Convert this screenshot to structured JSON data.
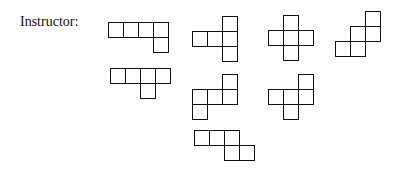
{
  "label": "Instructor:",
  "cell_size": 15,
  "stroke_color": "#111111",
  "shapes": [
    {
      "id": "shape-1",
      "x": 108,
      "y": 22,
      "cells": [
        [
          0,
          0
        ],
        [
          1,
          0
        ],
        [
          2,
          0
        ],
        [
          3,
          0
        ],
        [
          3,
          1
        ]
      ]
    },
    {
      "id": "shape-2",
      "x": 192,
      "y": 16,
      "cells": [
        [
          2,
          0
        ],
        [
          0,
          1
        ],
        [
          1,
          1
        ],
        [
          2,
          1
        ],
        [
          2,
          2
        ]
      ]
    },
    {
      "id": "shape-3",
      "x": 268,
      "y": 15,
      "cells": [
        [
          1,
          0
        ],
        [
          0,
          1
        ],
        [
          1,
          1
        ],
        [
          2,
          1
        ],
        [
          1,
          2
        ]
      ]
    },
    {
      "id": "shape-4",
      "x": 335,
      "y": 11,
      "cells": [
        [
          2,
          0
        ],
        [
          1,
          1
        ],
        [
          2,
          1
        ],
        [
          0,
          2
        ],
        [
          1,
          2
        ]
      ]
    },
    {
      "id": "shape-5",
      "x": 110,
      "y": 68,
      "cells": [
        [
          0,
          0
        ],
        [
          1,
          0
        ],
        [
          2,
          0
        ],
        [
          3,
          0
        ],
        [
          2,
          1
        ]
      ]
    },
    {
      "id": "shape-6",
      "x": 192,
      "y": 74,
      "cells": [
        [
          2,
          0
        ],
        [
          0,
          1
        ],
        [
          1,
          1
        ],
        [
          2,
          1
        ],
        [
          0,
          2
        ]
      ]
    },
    {
      "id": "shape-7",
      "x": 268,
      "y": 74,
      "cells": [
        [
          2,
          0
        ],
        [
          0,
          1
        ],
        [
          1,
          1
        ],
        [
          2,
          1
        ],
        [
          1,
          2
        ]
      ]
    },
    {
      "id": "shape-8",
      "x": 194,
      "y": 130,
      "cells": [
        [
          0,
          0
        ],
        [
          1,
          0
        ],
        [
          2,
          0
        ],
        [
          2,
          1
        ],
        [
          3,
          1
        ]
      ]
    }
  ]
}
